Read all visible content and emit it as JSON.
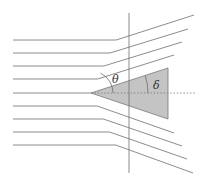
{
  "diagram": {
    "labels": {
      "shock_angle": "θ",
      "wedge_angle": "δ"
    },
    "colors": {
      "line": "#6e6e6e",
      "wedge_fill": "#c4c4c4",
      "wedge_stroke": "#7a7a7a",
      "dotted": "#7a7a7a"
    },
    "apex": [
      91,
      93
    ],
    "shock_top": [
      129,
      13
    ],
    "shock_bottom": [
      129,
      173
    ],
    "wedge": {
      "points": [
        [
          91,
          93
        ],
        [
          168,
          68
        ],
        [
          168,
          119
        ]
      ]
    },
    "upstream_lines_y": [
      40,
      53,
      66,
      79,
      93,
      106,
      119,
      132,
      145
    ],
    "upstream_start_x": 13,
    "downstream_upper_ends": [
      [
        194,
        15
      ],
      [
        188,
        29
      ],
      [
        182,
        42
      ],
      [
        174,
        55
      ]
    ],
    "downstream_lower_ends": [
      [
        174,
        133
      ],
      [
        182,
        146
      ],
      [
        187,
        159
      ],
      [
        193,
        173
      ]
    ],
    "centerline_end_x": 195
  }
}
